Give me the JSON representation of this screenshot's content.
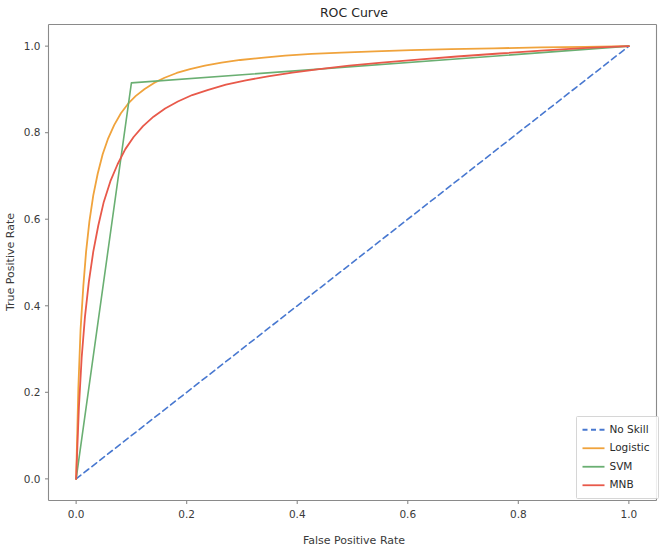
{
  "chart_data": {
    "type": "line",
    "title": "ROC Curve",
    "xlabel": "False Positive Rate",
    "ylabel": "True Positive Rate",
    "xlim": [
      -0.05,
      1.05
    ],
    "ylim": [
      -0.05,
      1.05
    ],
    "xticks": [
      "0.0",
      "0.2",
      "0.4",
      "0.6",
      "0.8",
      "1.0"
    ],
    "xtick_values": [
      0.0,
      0.2,
      0.4,
      0.6,
      0.8,
      1.0
    ],
    "yticks": [
      "0.0",
      "0.2",
      "0.4",
      "0.6",
      "0.8",
      "1.0"
    ],
    "ytick_values": [
      0.0,
      0.2,
      0.4,
      0.6,
      0.8,
      1.0
    ],
    "grid": false,
    "legend_position": "lower right",
    "series": [
      {
        "name": "No Skill",
        "color": "#4878d0",
        "style": "dashed",
        "width": 1.6,
        "points": [
          [
            0.0,
            0.0
          ],
          [
            1.0,
            1.0
          ]
        ]
      },
      {
        "name": "Logistic",
        "color": "#f0a33c",
        "style": "solid",
        "width": 1.8,
        "points": [
          [
            0.0,
            0.0
          ],
          [
            0.004,
            0.21
          ],
          [
            0.008,
            0.345
          ],
          [
            0.013,
            0.445
          ],
          [
            0.018,
            0.525
          ],
          [
            0.024,
            0.595
          ],
          [
            0.031,
            0.655
          ],
          [
            0.039,
            0.705
          ],
          [
            0.048,
            0.75
          ],
          [
            0.058,
            0.787
          ],
          [
            0.069,
            0.818
          ],
          [
            0.081,
            0.845
          ],
          [
            0.094,
            0.867
          ],
          [
            0.108,
            0.885
          ],
          [
            0.124,
            0.901
          ],
          [
            0.141,
            0.915
          ],
          [
            0.16,
            0.927
          ],
          [
            0.182,
            0.938
          ],
          [
            0.206,
            0.947
          ],
          [
            0.233,
            0.955
          ],
          [
            0.263,
            0.962
          ],
          [
            0.297,
            0.968
          ],
          [
            0.335,
            0.973
          ],
          [
            0.378,
            0.978
          ],
          [
            0.426,
            0.982
          ],
          [
            0.48,
            0.985
          ],
          [
            0.54,
            0.988
          ],
          [
            0.606,
            0.991
          ],
          [
            0.678,
            0.993
          ],
          [
            0.756,
            0.995
          ],
          [
            0.84,
            0.997
          ],
          [
            0.92,
            0.9985
          ],
          [
            1.0,
            1.0
          ]
        ]
      },
      {
        "name": "SVM",
        "color": "#6aaf72",
        "style": "solid",
        "width": 1.6,
        "points": [
          [
            0.0,
            0.0
          ],
          [
            0.1,
            0.915
          ],
          [
            1.0,
            1.0
          ]
        ]
      },
      {
        "name": "MNB",
        "color": "#e8594a",
        "style": "solid",
        "width": 1.8,
        "points": [
          [
            0.0,
            0.0
          ],
          [
            0.005,
            0.165
          ],
          [
            0.01,
            0.28
          ],
          [
            0.016,
            0.375
          ],
          [
            0.023,
            0.455
          ],
          [
            0.031,
            0.525
          ],
          [
            0.04,
            0.585
          ],
          [
            0.05,
            0.64
          ],
          [
            0.062,
            0.688
          ],
          [
            0.075,
            0.727
          ],
          [
            0.089,
            0.762
          ],
          [
            0.104,
            0.79
          ],
          [
            0.121,
            0.815
          ],
          [
            0.14,
            0.837
          ],
          [
            0.161,
            0.856
          ],
          [
            0.184,
            0.872
          ],
          [
            0.21,
            0.887
          ],
          [
            0.239,
            0.899
          ],
          [
            0.271,
            0.911
          ],
          [
            0.307,
            0.921
          ],
          [
            0.347,
            0.93
          ],
          [
            0.391,
            0.939
          ],
          [
            0.44,
            0.947
          ],
          [
            0.494,
            0.955
          ],
          [
            0.553,
            0.962
          ],
          [
            0.618,
            0.969
          ],
          [
            0.689,
            0.976
          ],
          [
            0.766,
            0.983
          ],
          [
            0.848,
            0.99
          ],
          [
            0.925,
            0.996
          ],
          [
            1.0,
            1.0
          ]
        ]
      }
    ]
  },
  "figure": {
    "background": "#ffffff",
    "axes_color": "#8a8a8a"
  }
}
